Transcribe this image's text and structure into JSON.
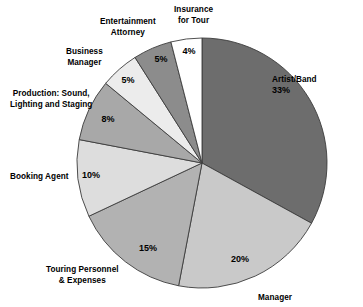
{
  "chart_data": {
    "type": "pie",
    "title": "",
    "subtitle": "",
    "xlabel": "",
    "ylabel": "",
    "legend_position": "none",
    "grid": false,
    "unit": "%",
    "total": 100,
    "categories": [
      "Artist/Band",
      "Manager",
      "Touring Personnel\n& Expenses",
      "Booking Agent",
      "Production: Sound,\nLighting and Staging",
      "Business\nManager",
      "Entertainment\nAttorney",
      "Insurance\nfor Tour"
    ],
    "values": [
      33,
      20,
      15,
      10,
      8,
      5,
      5,
      4
    ],
    "value_labels": [
      "33%",
      "20%",
      "15%",
      "10%",
      "8%",
      "5%",
      "5%",
      "4%"
    ],
    "slices": [
      {
        "label": "Artist/Band",
        "value": 33,
        "value_label": "33%",
        "color": "#6d6d6d",
        "label_x": 272,
        "label_y": 75,
        "label_align": "lbl-right",
        "value_x": 281,
        "value_y": 93
      },
      {
        "label": "Manager",
        "value": 20,
        "value_label": "20%",
        "color": "#c9c9c9",
        "label_x": 258,
        "label_y": 293,
        "label_align": "lbl-right",
        "value_x": 240,
        "value_y": 262
      },
      {
        "label": "Touring Personnel\n& Expenses",
        "value": 15,
        "value_label": "15%",
        "color": "#b2b2b2",
        "label_x": 46,
        "label_y": 265,
        "label_align": "lbl-center",
        "value_x": 148,
        "value_y": 251
      },
      {
        "label": "Booking Agent",
        "value": 10,
        "value_label": "10%",
        "color": "#dddddd",
        "label_x": 10,
        "label_y": 172,
        "label_align": "lbl-left",
        "value_x": 91,
        "value_y": 178
      },
      {
        "label": "Production: Sound,\nLighting and Staging",
        "value": 8,
        "value_label": "8%",
        "color": "#a8a8a8",
        "label_x": 10,
        "label_y": 89,
        "label_align": "lbl-center",
        "value_x": 108,
        "value_y": 122
      },
      {
        "label": "Business\nManager",
        "value": 5,
        "value_label": "5%",
        "color": "#ececec",
        "label_x": 66,
        "label_y": 47,
        "label_align": "lbl-center",
        "value_x": 128,
        "value_y": 83
      },
      {
        "label": "Entertainment\nAttorney",
        "value": 5,
        "value_label": "5%",
        "color": "#8c8c8c",
        "label_x": 100,
        "label_y": 17,
        "label_align": "lbl-center",
        "value_x": 161,
        "value_y": 62
      },
      {
        "label": "Insurance\nfor Tour",
        "value": 4,
        "value_label": "4%",
        "color": "#ffffff",
        "label_x": 174,
        "label_y": 5,
        "label_align": "lbl-center",
        "value_x": 189,
        "value_y": 54
      }
    ],
    "geometry": {
      "center_x": 202,
      "center_y": 163,
      "radius": 125,
      "start_angle_deg": 0,
      "direction": "clockwise"
    },
    "style": {
      "stroke": "#3c3c3c",
      "stroke_width": 0.9,
      "background": "#ffffff"
    }
  }
}
